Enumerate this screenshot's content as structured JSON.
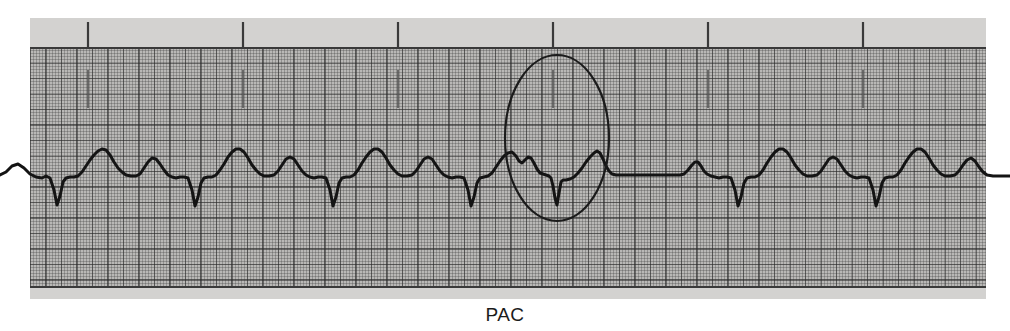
{
  "figure": {
    "kind": "ecg-rhythm-strip",
    "caption": "PAC",
    "caption_meaning": "Premature Atrial Contraction",
    "paper_color": "#b9b8b6",
    "grid_line_color": "#3a3a3a",
    "trace_color": "#141414",
    "annotation_color": "#1b1b1b"
  },
  "annotation": {
    "shape": "ellipse",
    "label": "PAC",
    "center_x": 557,
    "center_y": 138,
    "radius_x": 52,
    "radius_y": 83
  },
  "chart_data": {
    "type": "line",
    "title": "",
    "subtitle": "",
    "xlabel": "",
    "ylabel": "",
    "grid": true,
    "legend": null,
    "annotations": [
      {
        "text": "PAC",
        "type": "ellipse-callout",
        "x": 557,
        "y": 138,
        "describes": "premature atrial contraction beat followed by a non-compensatory pause"
      }
    ],
    "axis_notes": {
      "x_units": "time (ECG paper: 1 large box = 0.20 s)",
      "y_units": "amplitude (ECG paper: 1 large box = 0.5 mV)",
      "large_box_px": 15.5,
      "small_box_px": 3.1
    },
    "baseline_y_px": 175,
    "timing_marks_x_px": [
      88,
      243,
      398,
      553,
      708,
      863
    ],
    "beats": [
      {
        "index": 1,
        "r_peak_x": 85,
        "type": "sinus"
      },
      {
        "index": 2,
        "r_peak_x": 154,
        "type": "sinus"
      },
      {
        "index": 3,
        "r_peak_x": 223,
        "type": "sinus"
      },
      {
        "index": 4,
        "r_peak_x": 292,
        "type": "sinus"
      },
      {
        "index": 5,
        "r_peak_x": 361,
        "type": "sinus"
      },
      {
        "index": 6,
        "r_peak_x": 430,
        "type": "sinus"
      },
      {
        "index": 7,
        "r_peak_x": 499,
        "type": "sinus"
      },
      {
        "index": 8,
        "r_peak_x": 545,
        "type": "pac"
      },
      {
        "index": 9,
        "r_peak_x": 655,
        "type": "sinus"
      },
      {
        "index": 10,
        "r_peak_x": 724,
        "type": "sinus"
      },
      {
        "index": 11,
        "r_peak_x": 793,
        "type": "sinus"
      },
      {
        "index": 12,
        "r_peak_x": 862,
        "type": "sinus"
      },
      {
        "index": 13,
        "r_peak_x": 931,
        "type": "sinus"
      }
    ],
    "series": [
      {
        "name": "ECG lead II",
        "description": "Sinus rhythm with a single premature atrial contraction (PAC) occurring early after the 7th beat, followed by a pause before the rhythm resumes.",
        "points_px": [
          [
            0,
            175
          ],
          [
            6,
            172
          ],
          [
            12,
            166
          ],
          [
            18,
            164
          ],
          [
            24,
            168
          ],
          [
            30,
            174
          ],
          [
            36,
            177
          ],
          [
            42,
            178
          ],
          [
            46,
            176
          ],
          [
            50,
            178
          ],
          [
            54,
            190
          ],
          [
            57,
            205
          ],
          [
            60,
            196
          ],
          [
            63,
            182
          ],
          [
            66,
            178
          ],
          [
            70,
            177
          ],
          [
            74,
            177
          ],
          [
            78,
            176
          ],
          [
            82,
            172
          ],
          [
            86,
            166
          ],
          [
            90,
            160
          ],
          [
            94,
            155
          ],
          [
            98,
            151
          ],
          [
            102,
            149
          ],
          [
            106,
            150
          ],
          [
            110,
            155
          ],
          [
            114,
            162
          ],
          [
            118,
            168
          ],
          [
            122,
            172
          ],
          [
            126,
            175
          ],
          [
            131,
            176
          ],
          [
            136,
            176
          ],
          [
            140,
            174
          ],
          [
            144,
            168
          ],
          [
            148,
            162
          ],
          [
            152,
            158
          ],
          [
            156,
            159
          ],
          [
            160,
            164
          ],
          [
            164,
            170
          ],
          [
            168,
            175
          ],
          [
            172,
            177
          ],
          [
            176,
            178
          ],
          [
            180,
            177
          ],
          [
            184,
            177
          ],
          [
            188,
            178
          ],
          [
            192,
            190
          ],
          [
            195,
            206
          ],
          [
            198,
            197
          ],
          [
            201,
            183
          ],
          [
            204,
            178
          ],
          [
            208,
            177
          ],
          [
            212,
            177
          ],
          [
            216,
            175
          ],
          [
            220,
            170
          ],
          [
            224,
            164
          ],
          [
            228,
            157
          ],
          [
            232,
            152
          ],
          [
            236,
            149
          ],
          [
            240,
            149
          ],
          [
            244,
            152
          ],
          [
            248,
            158
          ],
          [
            252,
            165
          ],
          [
            256,
            170
          ],
          [
            260,
            174
          ],
          [
            264,
            176
          ],
          [
            269,
            176
          ],
          [
            274,
            175
          ],
          [
            278,
            171
          ],
          [
            282,
            165
          ],
          [
            286,
            159
          ],
          [
            290,
            157
          ],
          [
            294,
            159
          ],
          [
            298,
            165
          ],
          [
            302,
            171
          ],
          [
            306,
            175
          ],
          [
            310,
            177
          ],
          [
            314,
            178
          ],
          [
            318,
            177
          ],
          [
            322,
            177
          ],
          [
            326,
            178
          ],
          [
            330,
            190
          ],
          [
            333,
            206
          ],
          [
            336,
            197
          ],
          [
            339,
            183
          ],
          [
            342,
            178
          ],
          [
            346,
            177
          ],
          [
            350,
            177
          ],
          [
            354,
            175
          ],
          [
            358,
            170
          ],
          [
            362,
            163
          ],
          [
            366,
            157
          ],
          [
            370,
            152
          ],
          [
            374,
            149
          ],
          [
            378,
            149
          ],
          [
            382,
            152
          ],
          [
            386,
            158
          ],
          [
            390,
            165
          ],
          [
            394,
            170
          ],
          [
            398,
            174
          ],
          [
            402,
            176
          ],
          [
            407,
            176
          ],
          [
            412,
            175
          ],
          [
            416,
            171
          ],
          [
            420,
            165
          ],
          [
            424,
            159
          ],
          [
            428,
            157
          ],
          [
            432,
            159
          ],
          [
            436,
            165
          ],
          [
            440,
            171
          ],
          [
            444,
            175
          ],
          [
            448,
            177
          ],
          [
            452,
            178
          ],
          [
            456,
            177
          ],
          [
            460,
            177
          ],
          [
            464,
            178
          ],
          [
            468,
            190
          ],
          [
            471,
            206
          ],
          [
            474,
            197
          ],
          [
            477,
            183
          ],
          [
            480,
            178
          ],
          [
            484,
            177
          ],
          [
            488,
            176
          ],
          [
            492,
            173
          ],
          [
            496,
            167
          ],
          [
            500,
            161
          ],
          [
            504,
            156
          ],
          [
            508,
            153
          ],
          [
            512,
            152
          ],
          [
            516,
            156
          ],
          [
            519,
            161
          ],
          [
            522,
            163
          ],
          [
            525,
            160
          ],
          [
            528,
            157
          ],
          [
            531,
            158
          ],
          [
            534,
            163
          ],
          [
            537,
            169
          ],
          [
            540,
            173
          ],
          [
            543,
            174
          ],
          [
            546,
            175
          ],
          [
            549,
            176
          ],
          [
            551,
            178
          ],
          [
            553,
            186
          ],
          [
            555,
            198
          ],
          [
            557,
            205
          ],
          [
            559,
            193
          ],
          [
            561,
            182
          ],
          [
            563,
            180
          ],
          [
            566,
            180
          ],
          [
            570,
            179
          ],
          [
            574,
            177
          ],
          [
            578,
            173
          ],
          [
            582,
            168
          ],
          [
            586,
            162
          ],
          [
            590,
            157
          ],
          [
            594,
            153
          ],
          [
            597,
            151
          ],
          [
            600,
            153
          ],
          [
            603,
            159
          ],
          [
            606,
            166
          ],
          [
            609,
            171
          ],
          [
            612,
            174
          ],
          [
            616,
            175
          ],
          [
            620,
            175
          ],
          [
            626,
            175
          ],
          [
            634,
            175
          ],
          [
            642,
            175
          ],
          [
            650,
            175
          ],
          [
            658,
            175
          ],
          [
            666,
            175
          ],
          [
            674,
            175
          ],
          [
            680,
            175
          ],
          [
            684,
            174
          ],
          [
            688,
            170
          ],
          [
            692,
            165
          ],
          [
            695,
            162
          ],
          [
            698,
            162
          ],
          [
            701,
            166
          ],
          [
            704,
            171
          ],
          [
            707,
            174
          ],
          [
            711,
            176
          ],
          [
            715,
            177
          ],
          [
            719,
            178
          ],
          [
            723,
            177
          ],
          [
            727,
            177
          ],
          [
            731,
            178
          ],
          [
            735,
            190
          ],
          [
            738,
            206
          ],
          [
            741,
            197
          ],
          [
            744,
            183
          ],
          [
            747,
            178
          ],
          [
            751,
            177
          ],
          [
            755,
            177
          ],
          [
            759,
            175
          ],
          [
            763,
            170
          ],
          [
            767,
            163
          ],
          [
            771,
            157
          ],
          [
            775,
            152
          ],
          [
            779,
            149
          ],
          [
            783,
            149
          ],
          [
            787,
            152
          ],
          [
            791,
            158
          ],
          [
            795,
            165
          ],
          [
            799,
            170
          ],
          [
            803,
            174
          ],
          [
            807,
            176
          ],
          [
            812,
            176
          ],
          [
            817,
            175
          ],
          [
            821,
            171
          ],
          [
            825,
            165
          ],
          [
            829,
            159
          ],
          [
            833,
            157
          ],
          [
            837,
            159
          ],
          [
            841,
            165
          ],
          [
            845,
            171
          ],
          [
            849,
            175
          ],
          [
            853,
            177
          ],
          [
            857,
            178
          ],
          [
            861,
            177
          ],
          [
            865,
            177
          ],
          [
            869,
            178
          ],
          [
            873,
            190
          ],
          [
            876,
            206
          ],
          [
            879,
            197
          ],
          [
            882,
            183
          ],
          [
            885,
            178
          ],
          [
            889,
            177
          ],
          [
            893,
            177
          ],
          [
            897,
            175
          ],
          [
            901,
            170
          ],
          [
            905,
            163
          ],
          [
            909,
            157
          ],
          [
            913,
            152
          ],
          [
            917,
            149
          ],
          [
            921,
            149
          ],
          [
            925,
            152
          ],
          [
            929,
            158
          ],
          [
            933,
            165
          ],
          [
            937,
            170
          ],
          [
            941,
            174
          ],
          [
            945,
            176
          ],
          [
            950,
            176
          ],
          [
            955,
            175
          ],
          [
            959,
            171
          ],
          [
            963,
            165
          ],
          [
            967,
            160
          ],
          [
            971,
            158
          ],
          [
            975,
            161
          ],
          [
            979,
            167
          ],
          [
            983,
            172
          ],
          [
            987,
            175
          ],
          [
            993,
            176
          ],
          [
            1000,
            176
          ],
          [
            1010,
            176
          ]
        ]
      }
    ]
  }
}
